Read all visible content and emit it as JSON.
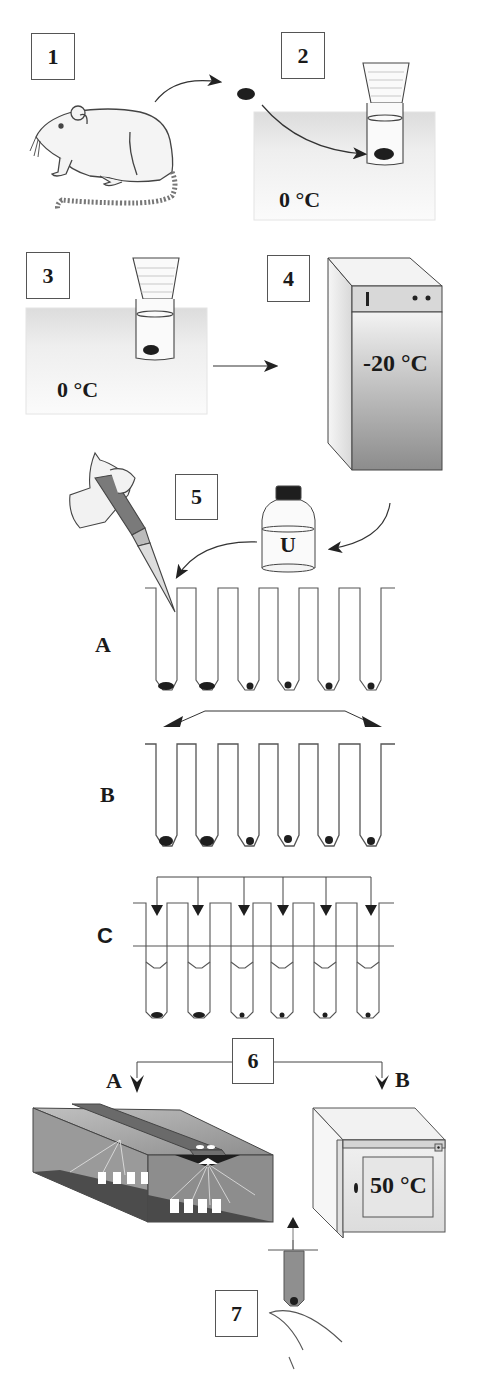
{
  "figure": {
    "type": "protocol-workflow-diagram",
    "steps": [
      {
        "number": "1",
        "depicts": "rat (tissue source)"
      },
      {
        "number": "2",
        "depicts": "tissue placed in tube on ice",
        "temperature": "0 °C"
      },
      {
        "number": "3",
        "depicts": "tube held on ice",
        "temperature": "0 °C"
      },
      {
        "number": "4",
        "depicts": "freezer storage",
        "temperature": "-20 °C"
      },
      {
        "number": "5",
        "depicts": "pipetting reagent from bottle into tube rows",
        "bottle_label": "U",
        "rows": [
          {
            "label": "A",
            "tube_count": 6
          },
          {
            "label": "B",
            "tube_count": 6
          },
          {
            "label": "C",
            "tube_count": 6
          }
        ]
      },
      {
        "number": "6",
        "depicts": "two processing options",
        "options": [
          {
            "label": "A",
            "depicts": "UV transilluminator / crosslinker"
          },
          {
            "label": "B",
            "depicts": "oven",
            "temperature": "50 °C"
          }
        ]
      },
      {
        "number": "7",
        "depicts": "tube sample removed"
      }
    ]
  },
  "labels": {
    "step1": "1",
    "step2": "2",
    "step3": "3",
    "step4": "4",
    "step5": "5",
    "step6": "6",
    "step7": "7",
    "temp_step2": "0 °C",
    "temp_step3": "0 °C",
    "temp_freezer": "-20 °C",
    "temp_oven": "50 °C",
    "bottle": "U",
    "row_a": "A",
    "row_b": "B",
    "row_c": "C",
    "option_a": "A",
    "option_b": "B"
  },
  "colors": {
    "line": "#3a3a3a",
    "ice_bath": "#e9e9e9",
    "freezer_dark": "#8a8a8a",
    "tissue": "#1e1e1e"
  }
}
